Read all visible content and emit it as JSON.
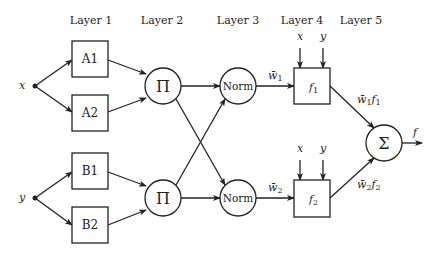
{
  "diagram": {
    "layers": [
      {
        "label": "Layer 1"
      },
      {
        "label": "Layer 2"
      },
      {
        "label": "Layer 3"
      },
      {
        "label": "Layer 4"
      },
      {
        "label": "Layer 5"
      }
    ],
    "inputs": {
      "x": "x",
      "y": "y"
    },
    "layer1_nodes": [
      "A1",
      "A2",
      "B1",
      "B2"
    ],
    "layer2_nodes": [
      "Π",
      "Π"
    ],
    "layer3_nodes": [
      "Norm",
      "Norm"
    ],
    "layer4_nodes": [
      {
        "label": "f",
        "sub": "1",
        "inputs": [
          "x",
          "y"
        ]
      },
      {
        "label": "f",
        "sub": "2",
        "inputs": [
          "x",
          "y"
        ]
      }
    ],
    "layer5_node": "Σ",
    "edge_labels": {
      "w1_bar": {
        "base": "w̄",
        "sub": "1"
      },
      "w2_bar": {
        "base": "w̄",
        "sub": "2"
      },
      "w1f1": {
        "base": "w̄",
        "sub": "1",
        "f": "f",
        "fsub": "1"
      },
      "w2f2": {
        "base": "w̄",
        "sub": "2",
        "f": "f",
        "fsub": "2"
      }
    },
    "output": "f"
  }
}
